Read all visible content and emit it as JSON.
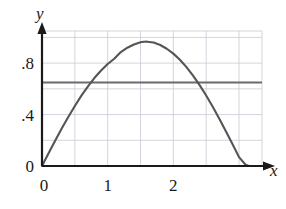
{
  "chart_data": {
    "type": "line",
    "title": "",
    "xlabel": "x",
    "ylabel": "y",
    "xlim": [
      0,
      3.35
    ],
    "ylim": [
      0,
      1.05
    ],
    "grid": true,
    "grid_x_step": 0.5,
    "grid_y_step": 0.2,
    "legend": "none",
    "xticks": [
      {
        "value": 0,
        "label": "0"
      },
      {
        "value": 1,
        "label": "1"
      },
      {
        "value": 2,
        "label": "2"
      }
    ],
    "yticks": [
      {
        "value": 0,
        "label": "0"
      },
      {
        "value": 0.4,
        "label": ".4"
      },
      {
        "value": 0.8,
        "label": ".8"
      }
    ],
    "series": [
      {
        "name": "curve",
        "type": "line",
        "color": "#555555",
        "comment": "arch rising from origin to peak then back to axis",
        "x": [
          0.0,
          0.1,
          0.2,
          0.3,
          0.4,
          0.5,
          0.6,
          0.7,
          0.8,
          0.9,
          1.0,
          1.1,
          1.2,
          1.3,
          1.4,
          1.5,
          1.55,
          1.6,
          1.7,
          1.8,
          1.9,
          2.0,
          2.1,
          2.2,
          2.3,
          2.4,
          2.5,
          2.6,
          2.7,
          2.8,
          2.9,
          3.0,
          3.1,
          3.15
        ],
        "y": [
          0.0,
          0.099,
          0.196,
          0.291,
          0.381,
          0.467,
          0.547,
          0.62,
          0.686,
          0.743,
          0.793,
          0.834,
          0.886,
          0.92,
          0.945,
          0.962,
          0.966,
          0.967,
          0.96,
          0.941,
          0.912,
          0.874,
          0.826,
          0.769,
          0.703,
          0.629,
          0.548,
          0.461,
          0.368,
          0.271,
          0.171,
          0.069,
          0.01,
          0.0
        ]
      },
      {
        "name": "horizontal-line",
        "type": "hline",
        "color": "#6b6b6b",
        "y_value": 0.65,
        "x_start": 0.0,
        "x_end": 3.2
      }
    ]
  },
  "axes": {
    "x_axis_label": "x",
    "y_axis_label": "y",
    "origin_label": "0"
  }
}
